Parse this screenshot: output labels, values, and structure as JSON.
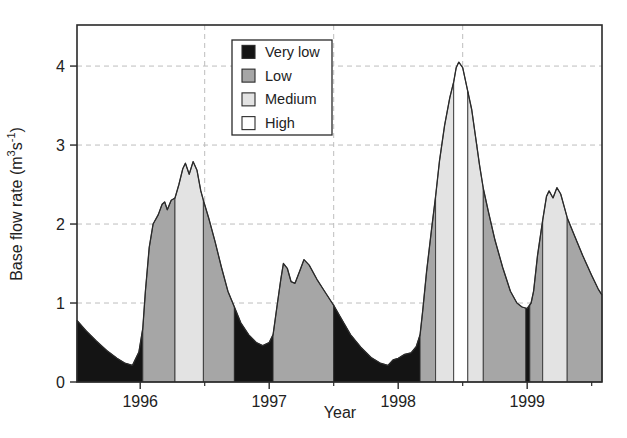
{
  "chart_data": {
    "type": "area",
    "title": "",
    "xlabel": "Year",
    "ylabel": "Base flow rate (m3s-1)",
    "ylabel_parts": {
      "pre": "Base flow rate (m",
      "sup1": "3",
      "mid": "s",
      "sup2": "-1",
      "post": ")"
    },
    "xlim": [
      1995.51,
      1999.58
    ],
    "ylim": [
      0,
      4.52
    ],
    "x_ticks": [
      {
        "value": 1996,
        "label": "1996"
      },
      {
        "value": 1997,
        "label": "1997"
      },
      {
        "value": 1998,
        "label": "1998"
      },
      {
        "value": 1999,
        "label": "1999"
      }
    ],
    "x_minor_ticks": [
      1996.5,
      1997.5,
      1998.5,
      1999.5
    ],
    "y_ticks": [
      {
        "value": 0,
        "label": "0"
      },
      {
        "value": 1,
        "label": "1"
      },
      {
        "value": 2,
        "label": "2"
      },
      {
        "value": 3,
        "label": "3"
      },
      {
        "value": 4,
        "label": "4"
      }
    ],
    "grid": {
      "style": "dashed",
      "color": "#bdbdbd",
      "x_values": [
        1996.5,
        1997.5,
        1998.5
      ],
      "y_values": [
        1,
        2,
        3,
        4
      ]
    },
    "axis_color": "#2a2a2a",
    "legend": {
      "position": "top-inside",
      "entries": [
        {
          "label": "Very low",
          "color": "#141414"
        },
        {
          "label": "Low",
          "color": "#a6a6a6"
        },
        {
          "label": "Medium",
          "color": "#e3e3e3"
        },
        {
          "label": "High",
          "color": "#ffffff"
        }
      ]
    },
    "bands": [
      {
        "from": 1995.51,
        "to": 1996.02,
        "category": "Very low"
      },
      {
        "from": 1996.02,
        "to": 1996.27,
        "category": "Low"
      },
      {
        "from": 1996.27,
        "to": 1996.49,
        "category": "Medium"
      },
      {
        "from": 1996.49,
        "to": 1996.73,
        "category": "Low"
      },
      {
        "from": 1996.73,
        "to": 1997.03,
        "category": "Very low"
      },
      {
        "from": 1997.03,
        "to": 1997.5,
        "category": "Low"
      },
      {
        "from": 1997.5,
        "to": 1998.17,
        "category": "Very low"
      },
      {
        "from": 1998.17,
        "to": 1998.29,
        "category": "Low"
      },
      {
        "from": 1998.29,
        "to": 1998.43,
        "category": "Medium"
      },
      {
        "from": 1998.43,
        "to": 1998.54,
        "category": "High"
      },
      {
        "from": 1998.54,
        "to": 1998.66,
        "category": "Medium"
      },
      {
        "from": 1998.66,
        "to": 1998.99,
        "category": "Low"
      },
      {
        "from": 1998.99,
        "to": 1999.02,
        "category": "Very low"
      },
      {
        "from": 1999.02,
        "to": 1999.12,
        "category": "Low"
      },
      {
        "from": 1999.12,
        "to": 1999.31,
        "category": "Medium"
      },
      {
        "from": 1999.31,
        "to": 1999.58,
        "category": "Low"
      }
    ],
    "curve": [
      [
        1995.51,
        0.78
      ],
      [
        1995.58,
        0.65
      ],
      [
        1995.66,
        0.52
      ],
      [
        1995.74,
        0.4
      ],
      [
        1995.82,
        0.3
      ],
      [
        1995.88,
        0.24
      ],
      [
        1995.94,
        0.21
      ],
      [
        1995.99,
        0.38
      ],
      [
        1996.02,
        0.68
      ],
      [
        1996.04,
        1.15
      ],
      [
        1996.07,
        1.7
      ],
      [
        1996.1,
        2.0
      ],
      [
        1996.14,
        2.12
      ],
      [
        1996.17,
        2.25
      ],
      [
        1996.19,
        2.28
      ],
      [
        1996.21,
        2.18
      ],
      [
        1996.24,
        2.3
      ],
      [
        1996.27,
        2.33
      ],
      [
        1996.3,
        2.5
      ],
      [
        1996.33,
        2.7
      ],
      [
        1996.35,
        2.77
      ],
      [
        1996.38,
        2.63
      ],
      [
        1996.41,
        2.79
      ],
      [
        1996.44,
        2.68
      ],
      [
        1996.47,
        2.42
      ],
      [
        1996.49,
        2.3
      ],
      [
        1996.53,
        2.08
      ],
      [
        1996.58,
        1.78
      ],
      [
        1996.63,
        1.45
      ],
      [
        1996.68,
        1.15
      ],
      [
        1996.73,
        0.95
      ],
      [
        1996.78,
        0.75
      ],
      [
        1996.84,
        0.6
      ],
      [
        1996.9,
        0.5
      ],
      [
        1996.95,
        0.46
      ],
      [
        1997.0,
        0.5
      ],
      [
        1997.03,
        0.6
      ],
      [
        1997.06,
        0.95
      ],
      [
        1997.09,
        1.3
      ],
      [
        1997.11,
        1.5
      ],
      [
        1997.14,
        1.44
      ],
      [
        1997.17,
        1.27
      ],
      [
        1997.2,
        1.25
      ],
      [
        1997.24,
        1.42
      ],
      [
        1997.27,
        1.55
      ],
      [
        1997.31,
        1.48
      ],
      [
        1997.37,
        1.3
      ],
      [
        1997.44,
        1.12
      ],
      [
        1997.5,
        0.97
      ],
      [
        1997.56,
        0.8
      ],
      [
        1997.63,
        0.6
      ],
      [
        1997.71,
        0.44
      ],
      [
        1997.79,
        0.31
      ],
      [
        1997.86,
        0.24
      ],
      [
        1997.92,
        0.21
      ],
      [
        1997.96,
        0.28
      ],
      [
        1998.0,
        0.3
      ],
      [
        1998.05,
        0.35
      ],
      [
        1998.1,
        0.37
      ],
      [
        1998.14,
        0.45
      ],
      [
        1998.17,
        0.6
      ],
      [
        1998.19,
        0.9
      ],
      [
        1998.22,
        1.4
      ],
      [
        1998.26,
        1.95
      ],
      [
        1998.29,
        2.35
      ],
      [
        1998.32,
        2.8
      ],
      [
        1998.36,
        3.25
      ],
      [
        1998.4,
        3.6
      ],
      [
        1998.43,
        3.8
      ],
      [
        1998.45,
        3.98
      ],
      [
        1998.47,
        4.05
      ],
      [
        1998.5,
        3.98
      ],
      [
        1998.53,
        3.75
      ],
      [
        1998.57,
        3.45
      ],
      [
        1998.6,
        3.1
      ],
      [
        1998.63,
        2.75
      ],
      [
        1998.66,
        2.45
      ],
      [
        1998.7,
        2.15
      ],
      [
        1998.75,
        1.8
      ],
      [
        1998.81,
        1.45
      ],
      [
        1998.87,
        1.15
      ],
      [
        1998.92,
        1.0
      ],
      [
        1998.96,
        0.95
      ],
      [
        1999.0,
        0.93
      ],
      [
        1999.03,
        1.0
      ],
      [
        1999.05,
        1.15
      ],
      [
        1999.08,
        1.6
      ],
      [
        1999.12,
        2.05
      ],
      [
        1999.15,
        2.35
      ],
      [
        1999.17,
        2.42
      ],
      [
        1999.2,
        2.33
      ],
      [
        1999.23,
        2.46
      ],
      [
        1999.26,
        2.38
      ],
      [
        1999.29,
        2.2
      ],
      [
        1999.31,
        2.08
      ],
      [
        1999.36,
        1.88
      ],
      [
        1999.43,
        1.6
      ],
      [
        1999.5,
        1.35
      ],
      [
        1999.55,
        1.18
      ],
      [
        1999.58,
        1.1
      ]
    ]
  }
}
